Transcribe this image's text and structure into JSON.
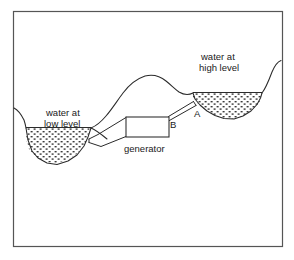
{
  "figure": {
    "width": 294,
    "height": 260,
    "background_color": "#ffffff",
    "line_color": "#2b2b2b",
    "frame_color": "#555555"
  },
  "labels": {
    "water_low_line1": "water at",
    "water_low_line2": "low level",
    "water_high_line1": "water at",
    "water_high_line2": "high level",
    "generator": "generator",
    "point_a": "A",
    "point_b": "B"
  },
  "elements": {
    "low_reservoir_name": "low-level water reservoir",
    "high_reservoir_name": "high-level water reservoir",
    "hill_name": "central hill terrain",
    "generator_name": "generator unit",
    "pipe_low_name": "pipe to low reservoir",
    "pipe_high_name": "pipe to high reservoir"
  }
}
